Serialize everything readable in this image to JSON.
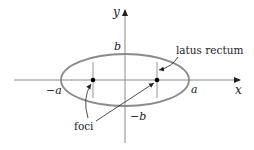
{
  "diagram": {
    "axes": {
      "x_label": "x",
      "y_label": "y"
    },
    "labels": {
      "b_top": "b",
      "b_bottom": "−b",
      "a_left": "−a",
      "a_right": "a",
      "latus_rectum": "latus rectum",
      "foci": "foci"
    },
    "colors": {
      "ellipse": "#8a8a8a",
      "axis": "#8a8a8a",
      "focus_point": "#000000",
      "text": "#222222"
    },
    "geometry": {
      "center": [
        125,
        80
      ],
      "semi_major_px": 64,
      "semi_minor_px": 26,
      "foci_x": [
        93,
        157
      ]
    }
  }
}
